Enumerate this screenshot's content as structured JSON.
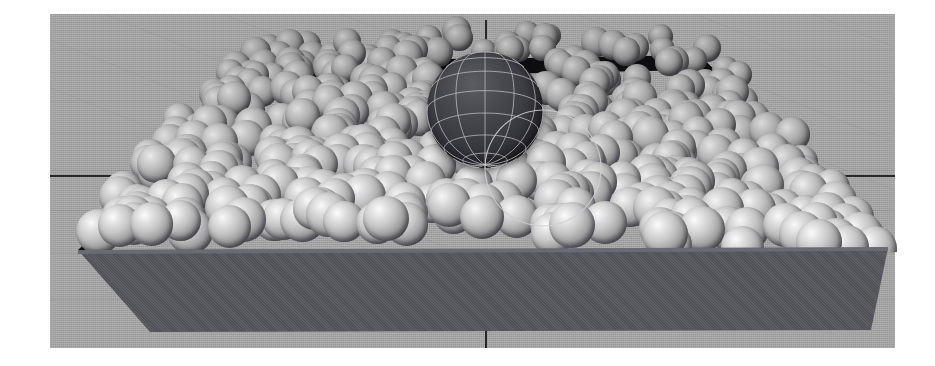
{
  "render": {
    "title": "Granular packing simulation — intruder sphere in particle bed",
    "canvas": {
      "width": 935,
      "height": 366,
      "background_color": "#ffffff"
    },
    "scene_type": "3d-physics-simulation-render",
    "view": "perspective",
    "margins": {
      "left": 50,
      "top": 14,
      "right": 40,
      "bottom": 18
    }
  },
  "ground": {
    "name": "ground-plane",
    "color": "#a8a8a8",
    "grid_visible": true,
    "grid_line_color": "#5a5a5f",
    "horizontal_rows": 11,
    "diagonal_lines": 9,
    "texture": "film-grain-noise"
  },
  "axes": {
    "horizontal_line_y": 175,
    "vertical_line_x": 485,
    "color": "#1c1c20",
    "label_h": "horizontal-axis-line",
    "label_v": "vertical-axis-line",
    "vertical_segments": [
      {
        "top": 20,
        "height": 26
      },
      {
        "top": 330,
        "height": 18
      }
    ]
  },
  "container": {
    "name": "particle-container-box",
    "shape": "open-top rectangular tray",
    "front_wall_color": "#55555c",
    "inner_wall_color": "#0e0e11",
    "lip_highlight_color": "#6a6a72",
    "corners": {
      "front_left": {
        "x": 78,
        "y": 250
      },
      "front_right": {
        "x": 888,
        "y": 248
      },
      "back_left": {
        "x": 272,
        "y": 62
      },
      "back_right": {
        "x": 700,
        "y": 55
      },
      "base_left": {
        "x": 150,
        "y": 332
      },
      "base_right": {
        "x": 871,
        "y": 330
      }
    },
    "wall_height_px": 82
  },
  "particles": {
    "name": "small-grain-spheres",
    "count": 520,
    "radius_range_px": [
      11,
      22
    ],
    "material": "light-gray-diffuse",
    "highlight_color": "#e9e9e9",
    "mid_color": "#b9b9ba",
    "shadow_color": "#3a3a40",
    "packing": "randomly heaped pile, mounded toward back-left"
  },
  "intruder": {
    "name": "large-intruder-sphere",
    "center": {
      "x": 485,
      "y": 110
    },
    "radius_px": 58,
    "style": "wireframe-shaded",
    "body_color": "#3d3d44",
    "wire_color": "#b9b9be",
    "meridians": 12,
    "parallels": 8,
    "description": "Large dark sphere with lat/long wireframe resting on top of the grain bed"
  }
}
